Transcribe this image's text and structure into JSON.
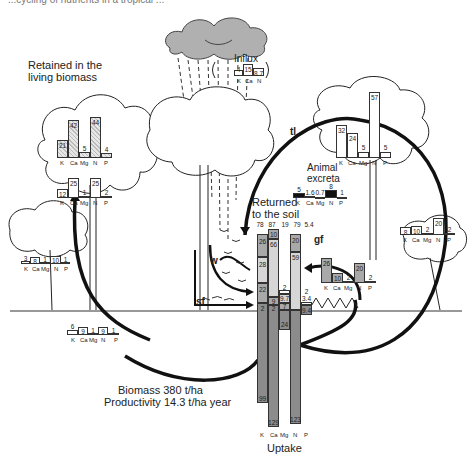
{
  "cut_off_header": "...cycling of nutrients in a tropical ...",
  "labels": {
    "retained": "Retained in the\nliving biomass",
    "retained_l1": "Retained in the",
    "retained_l2": "living biomass",
    "influx": "Influx",
    "returned_l1": "Returned",
    "returned_l2": "to the soil",
    "animal_l1": "Animal",
    "animal_l2": "excreta",
    "biomass": "Biomass 380 t/ha",
    "productivity": "Productivity 14.3 t/ha year",
    "uptake": "Uptake",
    "tl": "tl",
    "gf": "gf",
    "w": "w",
    "sf": "sf"
  },
  "element_labels": [
    "K",
    "Ca",
    "Mg",
    "N",
    "P"
  ],
  "influx": {
    "elements": [
      "K",
      "Ca",
      "N"
    ],
    "values": [
      "4",
      "15",
      "8.7"
    ]
  },
  "retained_big_tree": {
    "values": [
      "21",
      "42",
      "5",
      "44",
      "4"
    ]
  },
  "retained_trunk": {
    "values": [
      "12",
      "25",
      "1",
      "25",
      "2"
    ]
  },
  "small_tree_left": {
    "values": [
      "3",
      "8",
      "1",
      "10",
      "1"
    ]
  },
  "roots_left": {
    "values": [
      "6",
      "9",
      "1",
      "9",
      "1"
    ]
  },
  "animal_tree": {
    "values": [
      "32",
      "24",
      "5",
      "57",
      "5"
    ]
  },
  "animal_excreta": {
    "values": [
      "5",
      "1.6",
      "0.7",
      "8",
      "1"
    ]
  },
  "right_small_tree": {
    "values": [
      "8",
      "10",
      "2",
      "20",
      "2"
    ]
  },
  "gf_bars": {
    "values": [
      "26",
      "10",
      "2",
      "20",
      "2"
    ]
  },
  "returned_totals": {
    "values": [
      "78",
      "87",
      "19",
      "79",
      "5.4"
    ]
  },
  "uptake_columns": {
    "K": [
      "26",
      "28",
      "22",
      "2",
      "99"
    ],
    "Ca": [
      "10",
      "66",
      "9",
      "2",
      "129"
    ],
    "Mg": [
      "2",
      "9.7",
      "7",
      "24"
    ],
    "N": [
      "20",
      "59",
      "123"
    ],
    "P": [
      "2",
      "3.4",
      "9.4"
    ]
  },
  "colors": {
    "dark_gray": "#8c8c8c",
    "mid_gray": "#a9a9a9",
    "light_gray": "#d6d6d6",
    "cloud": "#b0b0b0",
    "line": "#111111"
  }
}
